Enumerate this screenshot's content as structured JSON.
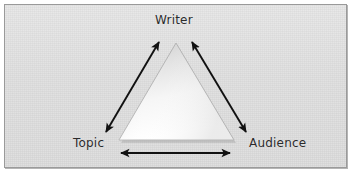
{
  "figure": {
    "type": "triangle-relationship-diagram",
    "panel": {
      "background_color": "#dcdcdc",
      "border_color": "#9a9a9a"
    }
  },
  "diagram": {
    "shape": {
      "name": "triangle",
      "fill_top_color": "#d4d4d4",
      "fill_bottom_color": "#ffffff",
      "outline_color": "#b0b0b0",
      "apex": {
        "x": 171,
        "y": 38
      },
      "bottom_left": {
        "x": 114,
        "y": 135
      },
      "bottom_right": {
        "x": 229,
        "y": 135
      }
    },
    "nodes": [
      {
        "id": "writer",
        "label": "Writer",
        "position": "top"
      },
      {
        "id": "topic",
        "label": "Topic",
        "position": "bottom-left"
      },
      {
        "id": "audience",
        "label": "Audience",
        "position": "bottom-right"
      }
    ],
    "connectors": [
      {
        "id": "topic-writer",
        "from": "topic",
        "to": "writer",
        "style": "double-headed-arrow",
        "color": "#111111",
        "x1": 101,
        "y1": 127,
        "x2": 154,
        "y2": 37
      },
      {
        "id": "writer-audience",
        "from": "writer",
        "to": "audience",
        "style": "double-headed-arrow",
        "color": "#111111",
        "x1": 187,
        "y1": 37,
        "x2": 241,
        "y2": 127
      },
      {
        "id": "topic-audience",
        "from": "topic",
        "to": "audience",
        "style": "double-headed-arrow",
        "color": "#111111",
        "x1": 116,
        "y1": 148,
        "x2": 225,
        "y2": 148
      }
    ]
  }
}
